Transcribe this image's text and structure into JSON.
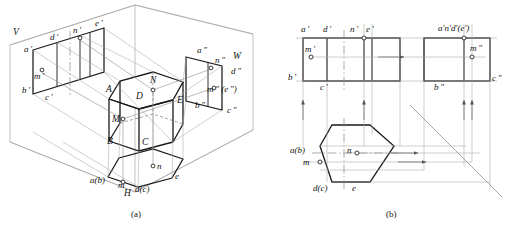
{
  "figure": {
    "captions": [
      {
        "id": "cap-a",
        "text": "(a)",
        "x": 131,
        "y": 211
      },
      {
        "id": "cap-b",
        "text": "(b)",
        "x": 386,
        "y": 211
      }
    ],
    "colors": {
      "ink": "#1a1a1a",
      "construction": "#8a8a8a",
      "thin": "#6f6f6f",
      "centerline": "#7a7a7a",
      "paper": "#ffffff"
    },
    "panel_a": {
      "name": "pictorial-three-plane-system",
      "plane_labels": [
        {
          "id": "plane-V",
          "text": "V",
          "x": 13,
          "y": 33
        },
        {
          "id": "plane-W",
          "text": "W",
          "x": 233,
          "y": 57
        },
        {
          "id": "plane-H",
          "text": "H",
          "x": 124,
          "y": 194
        }
      ],
      "front_view_labels": [
        {
          "id": "a-prime",
          "text": "a ′",
          "x": 26,
          "y": 52
        },
        {
          "id": "d-prime",
          "text": "d ′",
          "x": 51,
          "y": 40
        },
        {
          "id": "n-prime",
          "text": "n ′",
          "x": 74,
          "y": 33
        },
        {
          "id": "e-prime",
          "text": "e ′",
          "x": 96,
          "y": 26
        },
        {
          "id": "m-prime",
          "text": "m ′",
          "x": 36,
          "y": 75
        },
        {
          "id": "b-prime",
          "text": "b ′",
          "x": 24,
          "y": 88
        },
        {
          "id": "c-prime",
          "text": "c ′",
          "x": 46,
          "y": 97
        }
      ],
      "side_view_labels": [
        {
          "id": "a-dprime",
          "text": "a ″",
          "x": 199,
          "y": 52
        },
        {
          "id": "n-dprime",
          "text": "n ″",
          "x": 216,
          "y": 61
        },
        {
          "id": "d-dprime",
          "text": "d ″",
          "x": 232,
          "y": 72
        },
        {
          "id": "m-e-dprime",
          "text": "m ″ (e ″)",
          "x": 208,
          "y": 90
        },
        {
          "id": "b-dprime",
          "text": "b ″",
          "x": 196,
          "y": 105
        },
        {
          "id": "c-dprime",
          "text": "c ″",
          "x": 228,
          "y": 110
        }
      ],
      "top_view_labels": [
        {
          "id": "ab-top",
          "text": "a(b)",
          "x": 93,
          "y": 180
        },
        {
          "id": "m-top",
          "text": "m",
          "x": 119,
          "y": 184
        },
        {
          "id": "dc-top",
          "text": "d(c)",
          "x": 137,
          "y": 189
        },
        {
          "id": "e-top",
          "text": "e",
          "x": 175,
          "y": 176
        },
        {
          "id": "n-top",
          "text": "n",
          "x": 156,
          "y": 166
        }
      ],
      "solid_labels": [
        {
          "id": "vertex-A",
          "text": "A",
          "x": 108,
          "y": 90
        },
        {
          "id": "vertex-N",
          "text": "N",
          "x": 151,
          "y": 81
        },
        {
          "id": "vertex-D",
          "text": "D",
          "x": 137,
          "y": 96
        },
        {
          "id": "vertex-E",
          "text": "E",
          "x": 177,
          "y": 100
        },
        {
          "id": "vertex-M",
          "text": "M",
          "x": 113,
          "y": 120
        },
        {
          "id": "vertex-B",
          "text": "B",
          "x": 108,
          "y": 141
        },
        {
          "id": "vertex-C",
          "text": "C",
          "x": 143,
          "y": 142
        }
      ]
    },
    "panel_b": {
      "name": "orthographic-three-view-layout",
      "front_view_labels": [
        {
          "id": "b-a-prime",
          "text": "a ′",
          "x": 303,
          "y": 31
        },
        {
          "id": "b-d-prime",
          "text": "d ′",
          "x": 324,
          "y": 31
        },
        {
          "id": "b-n-prime",
          "text": "n ′",
          "x": 350,
          "y": 31
        },
        {
          "id": "b-e-prime",
          "text": "e ′",
          "x": 366,
          "y": 31
        },
        {
          "id": "b-m-prime",
          "text": "m ′",
          "x": 309,
          "y": 50
        },
        {
          "id": "b-b-prime",
          "text": "b ′",
          "x": 288,
          "y": 74
        },
        {
          "id": "b-c-prime",
          "text": "c ′",
          "x": 318,
          "y": 84
        }
      ],
      "side_view_labels": [
        {
          "id": "b-andeprime",
          "text": "a′n′d′(e′)",
          "x": 440,
          "y": 30
        },
        {
          "id": "b-m-dprime",
          "text": "m ″",
          "x": 471,
          "y": 50
        },
        {
          "id": "b-b-dprime",
          "text": "b ″",
          "x": 436,
          "y": 80
        },
        {
          "id": "b-c-dprime",
          "text": "c ″",
          "x": 492,
          "y": 76
        }
      ],
      "top_view_labels": [
        {
          "id": "b-ab-top",
          "text": "a(b)",
          "x": 290,
          "y": 150
        },
        {
          "id": "b-m-top",
          "text": "m",
          "x": 303,
          "y": 162
        },
        {
          "id": "b-dc-top",
          "text": "d(c)",
          "x": 315,
          "y": 187
        },
        {
          "id": "b-e-top",
          "text": "e",
          "x": 352,
          "y": 187
        },
        {
          "id": "b-n-top",
          "text": "n",
          "x": 346,
          "y": 153
        }
      ]
    }
  }
}
